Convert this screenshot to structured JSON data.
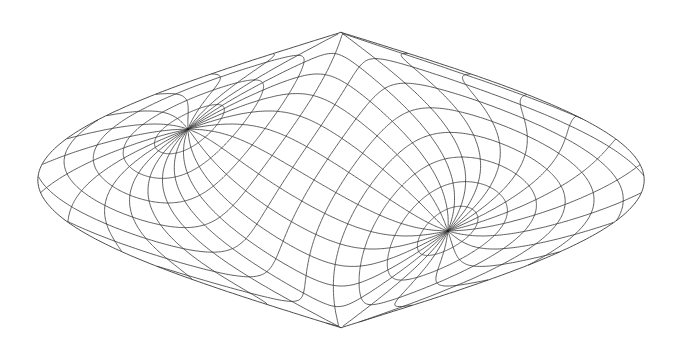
{
  "figure": {
    "type": "map-projection-graticule",
    "width": 677,
    "height": 343,
    "background": "#ffffff",
    "line_color": "#3a3a3a"
  },
  "projection": {
    "name": "oblique sinusoidal",
    "center_px": [
      341,
      180
    ],
    "scale_x_px_per_rad": 96.5,
    "scale_y_px_per_rad": 94,
    "north_pole_oblique_lat_deg": 31,
    "north_pole_oblique_lon_deg": -106,
    "north_pole_px": [
      188,
      129
    ],
    "south_pole_px": [
      451,
      231
    ]
  },
  "graticule": {
    "meridian_step_deg": 15,
    "parallel_step_deg": 15
  },
  "outline": {
    "top_px": [
      345,
      32
    ],
    "bottom_px": [
      339,
      327
    ],
    "left_px": [
      38,
      180
    ],
    "right_px": [
      645,
      185
    ]
  }
}
